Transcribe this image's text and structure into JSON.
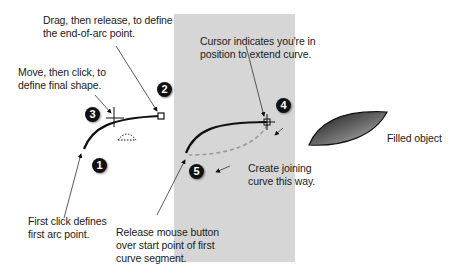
{
  "labels": {
    "drag_release": [
      "Drag, then release, to define",
      "the end-of-arc point."
    ],
    "move_click": [
      "Move, then click, to",
      "define final shape."
    ],
    "first_click": [
      "First click defines",
      "first arc point."
    ],
    "cursor_indicates": [
      "Cursor indicates you're in",
      "position to extend curve."
    ],
    "create_joining": [
      "Create joining",
      "curve this way."
    ],
    "release_mouse": [
      "Release mouse button",
      "over start point of first",
      "curve segment."
    ],
    "filled_object": "Filled object"
  },
  "badges": [
    "1",
    "2",
    "3",
    "4",
    "5"
  ],
  "colors": {
    "panel": "#d6d6d6",
    "badge": "#111111",
    "dashed_curve": "#9a9a9a"
  }
}
